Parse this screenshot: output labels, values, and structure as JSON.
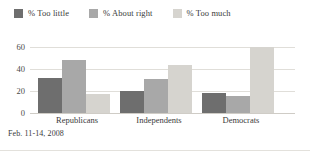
{
  "footnote": "Feb. 11-14, 2008",
  "legend": {
    "items": [
      {
        "label": "% Too little",
        "color": "#6e6e6e",
        "swatch_name": "legend-swatch-too-little"
      },
      {
        "label": "% About right",
        "color": "#a8a8a8",
        "swatch_name": "legend-swatch-about-right"
      },
      {
        "label": "% Too much",
        "color": "#d6d4cf",
        "swatch_name": "legend-swatch-too-much"
      }
    ]
  },
  "chart_data": {
    "type": "bar",
    "title": "",
    "subtitle": "",
    "xlabel": "",
    "ylabel": "",
    "categories": [
      "Republicans",
      "Independents",
      "Democrats"
    ],
    "series": [
      {
        "name": "% Too little",
        "color": "#6e6e6e",
        "values": [
          32,
          20,
          18
        ]
      },
      {
        "name": "% About right",
        "color": "#a8a8a8",
        "values": [
          48,
          31,
          15
        ]
      },
      {
        "name": "% Too much",
        "color": "#d6d4cf",
        "values": [
          17,
          43,
          60
        ]
      }
    ],
    "ylim": [
      0,
      65
    ],
    "yticks": [
      0,
      20,
      40,
      60
    ],
    "ytick_labels": [
      "0",
      "20",
      "40",
      "60"
    ],
    "grid": true,
    "legend_position": "top-left",
    "annotations": [
      "Feb. 11-14, 2008"
    ]
  }
}
